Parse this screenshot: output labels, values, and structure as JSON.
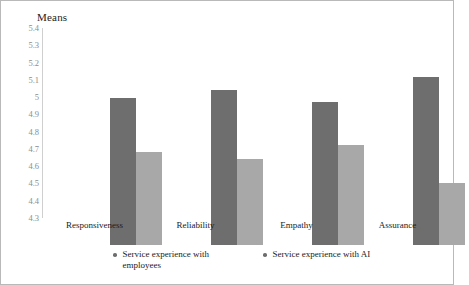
{
  "chart_data": {
    "type": "bar",
    "title": "Means",
    "xlabel": "",
    "ylabel": "",
    "ylim": [
      4.3,
      5.4
    ],
    "ytick_step": 0.1,
    "yticks": [
      "5.4",
      "5.3",
      "5.2",
      "5.1",
      "5",
      "4.9",
      "4.8",
      "4.7",
      "4.6",
      "4.5",
      "4.4",
      "4.3"
    ],
    "ytick_values": [
      5.4,
      5.3,
      5.2,
      5.1,
      5.0,
      4.9,
      4.8,
      4.7,
      4.6,
      4.5,
      4.4,
      4.3
    ],
    "grid": false,
    "legend_position": "bottom",
    "categories": [
      "Responsiveness",
      "Reliability",
      "Empathy",
      "Assurance"
    ],
    "series": [
      {
        "name": "Service experience with employees",
        "color": "#6e6e6e",
        "values": [
          5.15,
          5.2,
          5.13,
          5.27
        ]
      },
      {
        "name": "Service experience with AI",
        "color": "#a8a8a8",
        "values": [
          4.84,
          4.8,
          4.88,
          4.66
        ]
      }
    ]
  },
  "legend": {
    "marker": "dot-marker",
    "items": [
      {
        "label_line1": "Service experience with",
        "label_line2": "employees",
        "color": "#6e6e6e"
      },
      {
        "label_line1": "Service experience with AI",
        "label_line2": "",
        "color": "#6e6e6e"
      }
    ]
  },
  "axis": {
    "line_color": "#cfcfcf",
    "tick_label_color": "#8d8d8d"
  },
  "figure": {
    "border_color": "#b9b9b9",
    "background": "#ffffff"
  }
}
